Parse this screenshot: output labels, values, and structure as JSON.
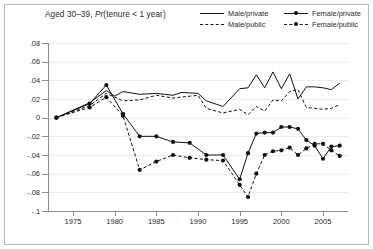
{
  "figure": {
    "title_prefix": "Aged 30–39, ",
    "title_italic": "Pr",
    "title_suffix": "(tenure < 1 year)",
    "title_full": "Aged 30–39, Pr(tenure < 1 year)"
  },
  "legend": {
    "items": [
      {
        "label": "Male/private",
        "style": "solid",
        "marker": false,
        "key": "male-private"
      },
      {
        "label": "Female/private",
        "style": "solid",
        "marker": true,
        "key": "female-private"
      },
      {
        "label": "Male/public",
        "style": "dashed",
        "marker": false,
        "key": "male-public"
      },
      {
        "label": "Female/public",
        "style": "dashed",
        "marker": true,
        "key": "female-public"
      }
    ]
  },
  "axes": {
    "y_ticks": [
      ".08",
      ".06",
      ".04",
      ".02",
      "0",
      "-.02",
      "-.04",
      "-.06",
      "-.08",
      "-.1"
    ],
    "y_values": [
      0.08,
      0.06,
      0.04,
      0.02,
      0,
      -0.02,
      -0.04,
      -0.06,
      -0.08,
      -0.1
    ],
    "x_ticks": [
      "1975",
      "1980",
      "1985",
      "1990",
      "1995",
      "2000",
      "2005"
    ],
    "x_values": [
      1975,
      1980,
      1985,
      1990,
      1995,
      2000,
      2005
    ]
  },
  "colors": {
    "line": "#111111",
    "grid": "#ececec",
    "axis": "#8d8d8d",
    "frame": "#b9b9b9",
    "text": "#2a2a2a",
    "background": "#ffffff"
  },
  "chart_data": {
    "type": "line",
    "title": "Aged 30–39, Pr(tenure < 1 year)",
    "xlabel": "",
    "ylabel": "",
    "xlim": [
      1972,
      2008
    ],
    "ylim": [
      -0.1,
      0.08
    ],
    "grid": true,
    "legend_position": "top-right",
    "series": [
      {
        "name": "Male/private",
        "style": "solid",
        "marker": "none",
        "x": [
          1973,
          1977,
          1979,
          1980,
          1981,
          1983,
          1985,
          1987,
          1988,
          1990,
          1991,
          1993,
          1995,
          1996,
          1997,
          1998,
          1999,
          2000,
          2001,
          2002,
          2003,
          2004,
          2005,
          2006,
          2007
        ],
        "y": [
          0.0,
          0.016,
          0.029,
          0.023,
          0.028,
          0.025,
          0.026,
          0.024,
          0.027,
          0.026,
          0.018,
          0.012,
          0.031,
          0.032,
          0.046,
          0.032,
          0.049,
          0.031,
          0.047,
          0.02,
          0.033,
          0.033,
          0.032,
          0.03,
          0.037
        ]
      },
      {
        "name": "Male/public",
        "style": "dashed",
        "marker": "none",
        "x": [
          1973,
          1977,
          1979,
          1980,
          1981,
          1983,
          1985,
          1987,
          1988,
          1990,
          1991,
          1993,
          1995,
          1996,
          1997,
          1998,
          1999,
          2000,
          2001,
          2002,
          2003,
          2004,
          2005,
          2006,
          2007
        ],
        "y": [
          0.0,
          0.013,
          0.026,
          0.022,
          0.018,
          0.019,
          0.024,
          0.021,
          0.022,
          0.024,
          0.01,
          0.005,
          0.009,
          0.003,
          0.012,
          0.007,
          0.019,
          0.018,
          0.028,
          0.03,
          0.011,
          0.01,
          0.009,
          0.01,
          0.014
        ]
      },
      {
        "name": "Female/private",
        "style": "solid",
        "marker": "circle",
        "x": [
          1973,
          1977,
          1979,
          1981,
          1983,
          1985,
          1987,
          1989,
          1991,
          1993,
          1995,
          1996,
          1997,
          1998,
          1999,
          2000,
          2001,
          2002,
          2003,
          2004,
          2005,
          2006,
          2007
        ],
        "y": [
          0.0,
          0.015,
          0.035,
          0.004,
          -0.02,
          -0.02,
          -0.026,
          -0.027,
          -0.04,
          -0.04,
          -0.066,
          -0.038,
          -0.017,
          -0.016,
          -0.016,
          -0.01,
          -0.01,
          -0.012,
          -0.024,
          -0.03,
          -0.044,
          -0.031,
          -0.03
        ]
      },
      {
        "name": "Female/public",
        "style": "dashed",
        "marker": "circle",
        "x": [
          1973,
          1977,
          1979,
          1981,
          1983,
          1985,
          1987,
          1989,
          1991,
          1993,
          1995,
          1996,
          1997,
          1998,
          1999,
          2000,
          2001,
          2002,
          2003,
          2004,
          2005,
          2006,
          2007
        ],
        "y": [
          0.0,
          0.011,
          0.022,
          0.002,
          -0.056,
          -0.047,
          -0.04,
          -0.043,
          -0.045,
          -0.046,
          -0.072,
          -0.085,
          -0.06,
          -0.04,
          -0.036,
          -0.035,
          -0.032,
          -0.04,
          -0.033,
          -0.028,
          -0.028,
          -0.035,
          -0.041
        ]
      }
    ]
  }
}
